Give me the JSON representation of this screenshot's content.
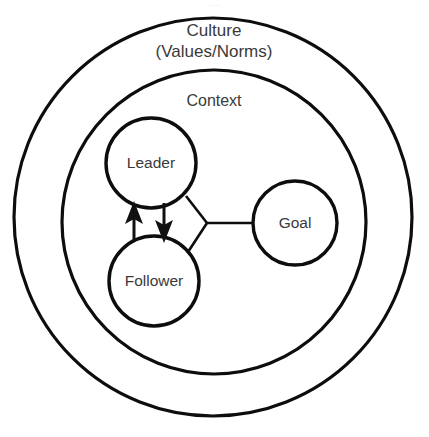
{
  "diagram": {
    "background_color": "#ffffff",
    "stroke_color": "#0d0d0d",
    "text_color": "#3a3a3a",
    "rings": [
      {
        "id": "culture",
        "label_line1": "Culture",
        "label_line2": "(Values/Norms)",
        "center_x": 213,
        "center_y": 217,
        "radius": 199
      },
      {
        "id": "context",
        "label_line1": "Context",
        "label_line2": "",
        "center_x": 214,
        "center_y": 222,
        "radius": 152
      }
    ],
    "nodes": [
      {
        "id": "leader",
        "label": "Leader",
        "center_x": 151,
        "center_y": 163,
        "radius": 45
      },
      {
        "id": "follower",
        "label": "Follower",
        "center_x": 154,
        "center_y": 281,
        "radius": 45
      },
      {
        "id": "goal",
        "label": "Goal",
        "center_x": 295,
        "center_y": 223,
        "radius": 42
      }
    ],
    "connectors": [
      {
        "id": "leader-to-junction",
        "from": "leader",
        "to": "junction"
      },
      {
        "id": "follower-to-junction",
        "from": "follower",
        "to": "junction"
      },
      {
        "id": "junction-to-goal",
        "from": "junction",
        "to": "goal"
      }
    ],
    "junction": {
      "x": 207,
      "y": 223
    },
    "arrows": [
      {
        "id": "follower-to-leader",
        "from": "follower",
        "to": "leader",
        "direction": "up",
        "x": 134
      },
      {
        "id": "leader-to-follower",
        "from": "leader",
        "to": "follower",
        "direction": "down",
        "x": 164
      }
    ],
    "ghost_text": "....."
  }
}
